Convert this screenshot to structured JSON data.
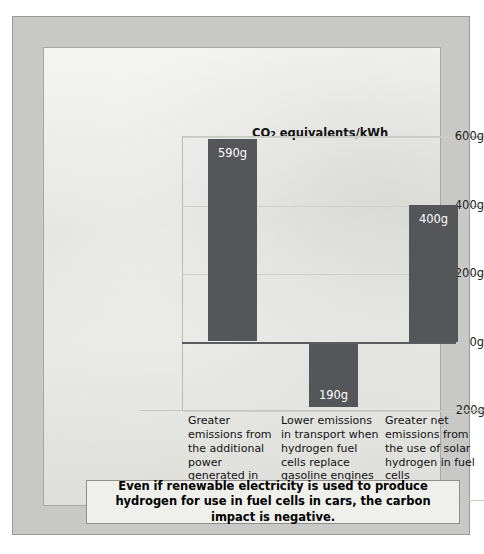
{
  "chart_data": {
    "type": "bar",
    "title": "CO2 equivalents/kWh",
    "title_main": "CO",
    "title_sub": "2",
    "title_rest": " equivalents/kWh",
    "xlabel": "",
    "ylabel": "CO2 equivalents/kWh",
    "ylim": [
      -200,
      600
    ],
    "grid": true,
    "legend": "none",
    "y_ticks": [
      {
        "value": 600,
        "label": "600g"
      },
      {
        "value": 400,
        "label": "400g"
      },
      {
        "value": 200,
        "label": "200g"
      },
      {
        "value": 0,
        "label": "0g"
      },
      {
        "value": -200,
        "label": "−200g"
      }
    ],
    "categories": [
      "Greater emissions from the additional power generated in fossil fuel plants",
      "Lower emissions in transport when hydrogen fuel cells replace gasoline engines",
      "Greater net emissions from the use of solar hydrogen in fuel cells"
    ],
    "values": [
      590,
      -190,
      400
    ],
    "value_labels": [
      "590g",
      "190g",
      "400g"
    ],
    "bar_color": "#55565a"
  },
  "captions": [
    "Greater emissions from the additional power generated in fossil fuel plants",
    "Lower emissions in transport when hydrogen fuel cells replace gasoline engines",
    "Greater net emissions from the use of solar hydrogen in fuel cells"
  ],
  "footer": {
    "text": "Even if renewable electricity is used to produce hydrogen for use in fuel cells in cars, the carbon impact is negative."
  }
}
